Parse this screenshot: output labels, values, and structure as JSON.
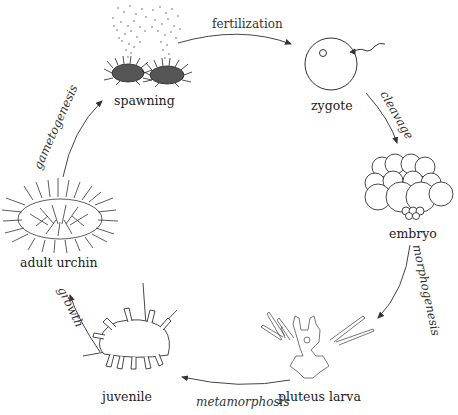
{
  "diagram": {
    "stages": [
      {
        "id": "spawning",
        "label": "spawning"
      },
      {
        "id": "zygote",
        "label": "zygote"
      },
      {
        "id": "embryo",
        "label": "embryo"
      },
      {
        "id": "pluteus-larva",
        "label": "pluteus larva"
      },
      {
        "id": "juvenile",
        "label": "juvenile"
      },
      {
        "id": "adult-urchin",
        "label": "adult urchin"
      }
    ],
    "processes": [
      {
        "from": "spawning",
        "to": "zygote",
        "label": "fertilization"
      },
      {
        "from": "zygote",
        "to": "embryo",
        "label": "cleavage"
      },
      {
        "from": "embryo",
        "to": "pluteus-larva",
        "label": "morphogenesis"
      },
      {
        "from": "pluteus-larva",
        "to": "juvenile",
        "label": "metamorphosis"
      },
      {
        "from": "juvenile",
        "to": "adult-urchin",
        "label": "growth"
      },
      {
        "from": "adult-urchin",
        "to": "spawning",
        "label": "gametogenesis"
      }
    ],
    "colors": {
      "line": "#333333",
      "background": "#ffffff"
    }
  }
}
